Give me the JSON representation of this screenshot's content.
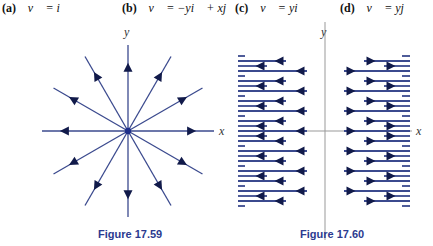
{
  "labels": [
    {
      "tag": "(a)",
      "equation": "v⃗ = i⃗"
    },
    {
      "tag": "(b)",
      "equation": "v⃗ = −yi⃗ + xj⃗"
    },
    {
      "tag": "(c)",
      "equation": "v⃗ = yi⃗"
    },
    {
      "tag": "(d)",
      "equation": "v⃗ = yj⃗"
    }
  ],
  "figures": [
    {
      "caption": "Figure 17.59",
      "x_label": "x",
      "y_label": "y",
      "type": "radial-vector-field",
      "directions_deg": [
        0,
        30,
        60,
        90,
        120,
        150,
        180,
        210,
        240,
        270,
        300,
        330
      ]
    },
    {
      "caption": "Figure 17.60",
      "x_label": "x",
      "y_label": "y",
      "type": "outward-horizontal-vector-field",
      "row_pattern_from_axis": [
        "long",
        "short",
        "medium",
        "dash"
      ]
    }
  ],
  "colors": {
    "vector": "#3b4a8e",
    "center": "#1f2f8a",
    "axis": "#999999",
    "caption": "#2b3a8f"
  }
}
